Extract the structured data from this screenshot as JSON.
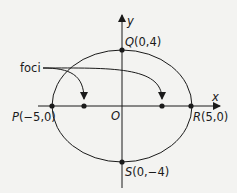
{
  "diagram": {
    "type": "ellipse",
    "equation_params": {
      "a": 5,
      "b": 4
    },
    "axes": {
      "x_label": "x",
      "y_label": "y",
      "origin_label": "O"
    },
    "points": [
      {
        "id": "P",
        "name": "P",
        "coords": "(−5,0)"
      },
      {
        "id": "Q",
        "name": "Q",
        "coords": "(0,4)"
      },
      {
        "id": "R",
        "name": "R",
        "coords": "(5,0)"
      },
      {
        "id": "S",
        "name": "S",
        "coords": "(0,−4)"
      }
    ],
    "foci_label": "foci",
    "colors": {
      "stroke": "#1a1a1a",
      "background": "#f3f3f1"
    }
  }
}
